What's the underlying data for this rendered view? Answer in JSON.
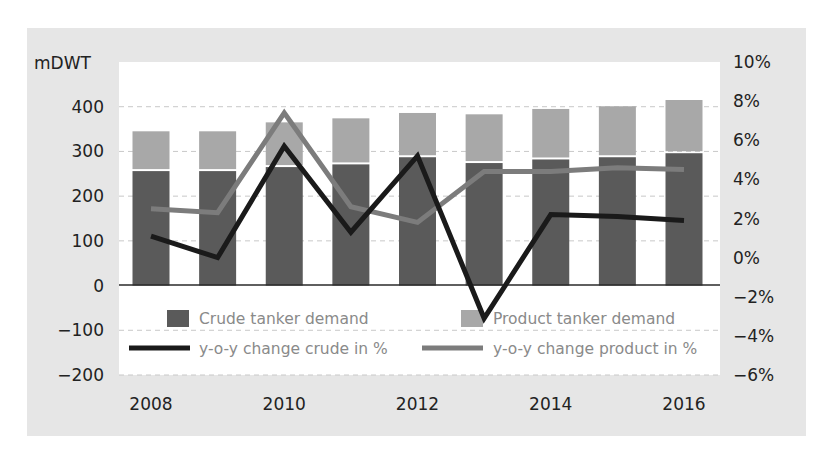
{
  "chart_data": {
    "type": "bar",
    "subtype": "stacked-bar-with-lines-dual-axis",
    "title": "",
    "x": [
      2008,
      2009,
      2010,
      2011,
      2012,
      2013,
      2014,
      2015,
      2016
    ],
    "x_tick_labels": [
      "2008",
      "2010",
      "2012",
      "2014",
      "2016"
    ],
    "ylabel_left": "mDWT",
    "ylim_left": [
      -200,
      500
    ],
    "y_ticks_left": [
      "400",
      "300",
      "200",
      "100",
      "0",
      "−100",
      "−200"
    ],
    "y_ticks_left_values": [
      400,
      300,
      200,
      100,
      0,
      -100,
      -200
    ],
    "ylim_right": [
      -6,
      10
    ],
    "y_ticks_right": [
      "10%",
      "8%",
      "6%",
      "4%",
      "2%",
      "0%",
      "−2%",
      "−4%",
      "−6%"
    ],
    "y_ticks_right_values": [
      10,
      8,
      6,
      4,
      2,
      0,
      -2,
      -4,
      -6
    ],
    "grid": "horizontal dashed",
    "legend_position": "bottom inside plot",
    "series": [
      {
        "name": "Crude tanker demand",
        "type": "bar",
        "axis": "left",
        "color": "#5a5a5a",
        "values": [
          256,
          256,
          265,
          271,
          287,
          274,
          282,
          287,
          296
        ]
      },
      {
        "name": "Product tanker demand",
        "type": "bar",
        "axis": "left",
        "stacked_on": "Crude tanker demand",
        "color": "#a8a8a8",
        "values": [
          89,
          89,
          100,
          103,
          99,
          109,
          113,
          114,
          119
        ]
      },
      {
        "name": "y-o-y change crude in %",
        "type": "line",
        "axis": "right",
        "color": "#1a1a1a",
        "values": [
          1.1,
          0.0,
          5.7,
          1.3,
          5.2,
          -3.1,
          2.2,
          2.1,
          1.9
        ]
      },
      {
        "name": "y-o-y change product in %",
        "type": "line",
        "axis": "right",
        "color": "#7c7c7c",
        "values": [
          2.5,
          2.3,
          7.4,
          2.6,
          1.8,
          4.4,
          4.4,
          4.6,
          4.5
        ]
      }
    ]
  },
  "legend": {
    "crude_bar": "Crude tanker demand",
    "product_bar": "Product tanker demand",
    "crude_line": "y-o-y change crude in %",
    "product_line": "y-o-y change product in %"
  },
  "colors": {
    "panel": "#e6e6e6",
    "plot": "#ffffff",
    "crude_bar": "#5a5a5a",
    "product_bar": "#a8a8a8",
    "crude_line": "#1a1a1a",
    "product_line": "#7c7c7c"
  }
}
